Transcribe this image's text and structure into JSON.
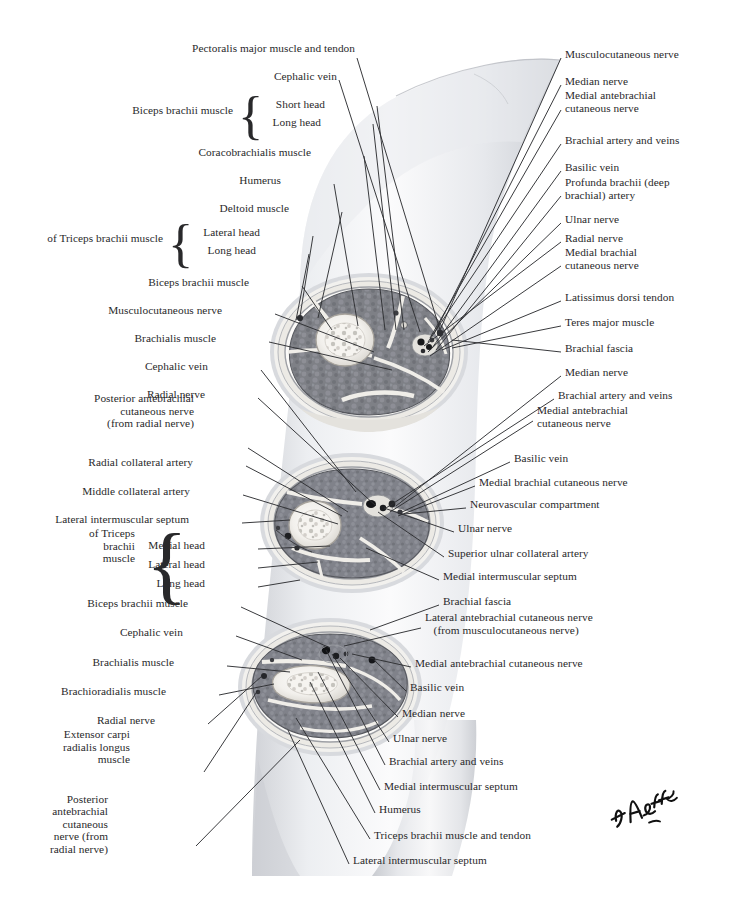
{
  "plate": {
    "title": "Serial Cross Sections Through Arm",
    "signature": "F. Netter",
    "background_color": "#ffffff",
    "ink_color": "#29292b",
    "muscle_color": "#7f8086",
    "fascia_color": "#eceae6",
    "bone_color": "#f4f2ee",
    "skin_color": "#d9dade"
  },
  "left_labels": [
    {
      "id": "pectoralis-major-muscle-and-tendon",
      "text": "Pectoralis major muscle and tendon",
      "x": 355,
      "y": 48,
      "lines": 1
    },
    {
      "id": "cephalic-vein-1",
      "text": "Cephalic vein",
      "x": 337,
      "y": 76,
      "lines": 1
    },
    {
      "id": "biceps-brachii-muscle-1",
      "text": "Biceps brachii muscle",
      "x": 233,
      "y": 110,
      "lines": 1
    },
    {
      "id": "short-head",
      "text": "Short head",
      "x": 325,
      "y": 104,
      "lines": 1
    },
    {
      "id": "long-head-1",
      "text": "Long head",
      "x": 321,
      "y": 122,
      "lines": 1
    },
    {
      "id": "coracobrachialis-muscle",
      "text": "Coracobrachialis muscle",
      "x": 311,
      "y": 152,
      "lines": 1
    },
    {
      "id": "humerus-1",
      "text": "Humerus",
      "x": 281,
      "y": 180,
      "lines": 1
    },
    {
      "id": "deltoid-muscle",
      "text": "Deltoid muscle",
      "x": 289,
      "y": 208,
      "lines": 1
    },
    {
      "id": "of-triceps-brachii-muscle",
      "text": "of Triceps brachii muscle",
      "x": 163,
      "y": 238,
      "lines": 1
    },
    {
      "id": "lateral-head-1",
      "text": "Lateral head",
      "x": 260,
      "y": 232,
      "lines": 1
    },
    {
      "id": "long-head-2",
      "text": "Long head",
      "x": 256,
      "y": 250,
      "lines": 1
    },
    {
      "id": "biceps-brachii-muscle-2",
      "text": "Biceps brachii muscle",
      "x": 249,
      "y": 282,
      "lines": 1
    },
    {
      "id": "musculocutaneous-nerve-left",
      "text": "Musculocutaneous nerve",
      "x": 222,
      "y": 310,
      "lines": 1
    },
    {
      "id": "brachialis-muscle-1",
      "text": "Brachialis muscle",
      "x": 216,
      "y": 338,
      "lines": 1
    },
    {
      "id": "cephalic-vein-2",
      "text": "Cephalic vein",
      "x": 208,
      "y": 366,
      "lines": 1
    },
    {
      "id": "radial-nerve-left-1",
      "text": "Radial nerve",
      "x": 205,
      "y": 394,
      "lines": 1
    },
    {
      "id": "posterior-antebrachial-cutaneous-nerve-1",
      "text": "Posterior antebrachial\ncutaneous nerve\n(from radial nerve)",
      "x": 194,
      "y": 411,
      "lines": 3
    },
    {
      "id": "radial-collateral-artery",
      "text": "Radial collateral artery",
      "x": 193,
      "y": 462,
      "lines": 1
    },
    {
      "id": "middle-collateral-artery",
      "text": "Middle collateral artery",
      "x": 190,
      "y": 491,
      "lines": 1
    },
    {
      "id": "lateral-intermuscular-septum-1",
      "text": "Lateral intermuscular septum",
      "x": 189,
      "y": 519,
      "lines": 1
    },
    {
      "id": "of-triceps-brachii-muscle-2",
      "text": "of Triceps\nbrachii\nmuscle",
      "x": 135,
      "y": 546,
      "lines": 3
    },
    {
      "id": "medial-head",
      "text": "Medial head",
      "x": 205,
      "y": 545,
      "lines": 1
    },
    {
      "id": "lateral-head-2",
      "text": "Lateral head",
      "x": 205,
      "y": 564,
      "lines": 1
    },
    {
      "id": "long-head-3",
      "text": "Long head",
      "x": 205,
      "y": 583,
      "lines": 1
    },
    {
      "id": "biceps-brachii-muscle-3",
      "text": "Biceps brachii muscle",
      "x": 188,
      "y": 603,
      "lines": 1
    },
    {
      "id": "cephalic-vein-3",
      "text": "Cephalic vein",
      "x": 183,
      "y": 632,
      "lines": 1
    },
    {
      "id": "brachialis-muscle-2",
      "text": "Brachialis muscle",
      "x": 174,
      "y": 662,
      "lines": 1
    },
    {
      "id": "brachioradialis-muscle",
      "text": "Brachioradialis muscle",
      "x": 166,
      "y": 691,
      "lines": 1
    },
    {
      "id": "radial-nerve-left-2",
      "text": "Radial nerve",
      "x": 155,
      "y": 720,
      "lines": 1
    },
    {
      "id": "extensor-carpi-radialis-longus-muscle",
      "text": "Extensor carpi\nradialis longus\nmuscle",
      "x": 130,
      "y": 747,
      "lines": 3
    },
    {
      "id": "posterior-antebrachial-cutaneous-nerve-2",
      "text": "Posterior\nantebrachial\ncutaneous\nnerve (from\nradial nerve)",
      "x": 108,
      "y": 824,
      "lines": 5
    }
  ],
  "right_labels": [
    {
      "id": "musculocutaneous-nerve-right",
      "text": "Musculocutaneous nerve",
      "x": 565,
      "y": 54,
      "lines": 1
    },
    {
      "id": "median-nerve-1",
      "text": "Median nerve",
      "x": 565,
      "y": 81,
      "lines": 1
    },
    {
      "id": "medial-antebrachial-cutaneous-nerve-1",
      "text": "Medial antebrachial\ncutaneous nerve",
      "x": 565,
      "y": 102,
      "lines": 2
    },
    {
      "id": "brachial-artery-and-veins-1",
      "text": "Brachial artery and veins",
      "x": 565,
      "y": 140,
      "lines": 1
    },
    {
      "id": "basilic-vein-1",
      "text": "Basilic vein",
      "x": 565,
      "y": 167,
      "lines": 1
    },
    {
      "id": "profunda-brachii-artery",
      "text": "Profunda brachii (deep\nbrachial) artery",
      "x": 565,
      "y": 189,
      "lines": 2
    },
    {
      "id": "ulnar-nerve-1",
      "text": "Ulnar nerve",
      "x": 565,
      "y": 219,
      "lines": 1
    },
    {
      "id": "radial-nerve-right-1",
      "text": "Radial nerve",
      "x": 565,
      "y": 238,
      "lines": 1
    },
    {
      "id": "medial-brachial-cutaneous-nerve-1",
      "text": "Medial brachial\ncutaneous nerve",
      "x": 565,
      "y": 259,
      "lines": 2
    },
    {
      "id": "latissimus-dorsi-tendon",
      "text": "Latissimus dorsi tendon",
      "x": 565,
      "y": 297,
      "lines": 1
    },
    {
      "id": "teres-major-muscle",
      "text": "Teres major muscle",
      "x": 565,
      "y": 322,
      "lines": 1
    },
    {
      "id": "brachial-fascia-1",
      "text": "Brachial fascia",
      "x": 565,
      "y": 348,
      "lines": 1
    },
    {
      "id": "median-nerve-2",
      "text": "Median nerve",
      "x": 565,
      "y": 372,
      "lines": 1
    },
    {
      "id": "brachial-artery-and-veins-2",
      "text": "Brachial artery and veins",
      "x": 558,
      "y": 395,
      "lines": 1
    },
    {
      "id": "medial-antebrachial-cutaneous-nerve-2",
      "text": "Medial antebrachial\ncutaneous nerve",
      "x": 537,
      "y": 417,
      "lines": 2
    },
    {
      "id": "basilic-vein-2",
      "text": "Basilic vein",
      "x": 514,
      "y": 458,
      "lines": 1
    },
    {
      "id": "medial-brachial-cutaneous-nerve-2",
      "text": "Medial brachial cutaneous nerve",
      "x": 479,
      "y": 482,
      "lines": 1
    },
    {
      "id": "neurovascular-compartment",
      "text": "Neurovascular compartment",
      "x": 470,
      "y": 504,
      "lines": 1
    },
    {
      "id": "ulnar-nerve-2",
      "text": "Ulnar nerve",
      "x": 458,
      "y": 528,
      "lines": 1
    },
    {
      "id": "superior-ulnar-collateral-artery",
      "text": "Superior ulnar collateral artery",
      "x": 448,
      "y": 553,
      "lines": 1
    },
    {
      "id": "medial-intermuscular-septum-1",
      "text": "Medial intermuscular septum",
      "x": 443,
      "y": 576,
      "lines": 1
    },
    {
      "id": "brachial-fascia-2",
      "text": "Brachial fascia",
      "x": 443,
      "y": 601,
      "lines": 1
    },
    {
      "id": "lateral-antebrachial-cutaneous-nerve",
      "text": "Lateral antebrachial cutaneous nerve\n   (from musculocutaneous nerve)",
      "x": 425,
      "y": 624,
      "lines": 2
    },
    {
      "id": "medial-antebrachial-cutaneous-nerve-3",
      "text": "Medial antebrachial cutaneous nerve",
      "x": 415,
      "y": 663,
      "lines": 1
    },
    {
      "id": "basilic-vein-3",
      "text": "Basilic vein",
      "x": 410,
      "y": 687,
      "lines": 1
    },
    {
      "id": "median-nerve-3",
      "text": "Median nerve",
      "x": 402,
      "y": 713,
      "lines": 1
    },
    {
      "id": "ulnar-nerve-3",
      "text": "Ulnar nerve",
      "x": 393,
      "y": 738,
      "lines": 1
    },
    {
      "id": "brachial-artery-and-veins-3",
      "text": "Brachial artery and veins",
      "x": 389,
      "y": 761,
      "lines": 1
    },
    {
      "id": "medial-intermuscular-septum-2",
      "text": "Medial intermuscular septum",
      "x": 384,
      "y": 786,
      "lines": 1
    },
    {
      "id": "humerus-2",
      "text": "Humerus",
      "x": 379,
      "y": 809,
      "lines": 1
    },
    {
      "id": "triceps-brachii-muscle-and-tendon",
      "text": "Triceps brachii muscle and tendon",
      "x": 374,
      "y": 835,
      "lines": 1
    },
    {
      "id": "lateral-intermuscular-septum-2",
      "text": "Lateral intermuscular septum",
      "x": 353,
      "y": 860,
      "lines": 1
    }
  ],
  "braces": [
    {
      "id": "brace-biceps-heads",
      "x": 238,
      "y": 98,
      "height": 34
    },
    {
      "id": "brace-triceps-heads-upper",
      "x": 168,
      "y": 226,
      "height": 34
    },
    {
      "id": "brace-triceps-heads-lower",
      "x": 146,
      "y": 536,
      "height": 56
    }
  ],
  "sections": [
    {
      "id": "upper-arm-section",
      "label": "proximal arm cross section",
      "cx": 369,
      "cy": 352,
      "rx": 97,
      "ry": 76
    },
    {
      "id": "mid-arm-section",
      "label": "mid arm cross section",
      "cx": 352,
      "cy": 523,
      "rx": 90,
      "ry": 68
    },
    {
      "id": "distal-arm-section",
      "label": "distal arm cross section",
      "cx": 330,
      "cy": 687,
      "rx": 90,
      "ry": 66
    }
  ]
}
